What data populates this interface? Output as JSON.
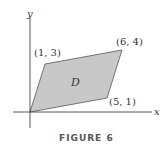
{
  "figure": {
    "caption": "FIGURE 6",
    "x_axis_label": "x",
    "y_axis_label": "y",
    "region_label": "D",
    "region_fill": "#c8c8c8",
    "region_stroke": "#555555",
    "axis_color": "#444444",
    "vertices": [
      {
        "label": "(0, 0)",
        "x": 0,
        "y": 0,
        "shown": false
      },
      {
        "label": "(5, 1)",
        "x": 5,
        "y": 1
      },
      {
        "label": "(6, 4)",
        "x": 6,
        "y": 4
      },
      {
        "label": "(1, 3)",
        "x": 1,
        "y": 3
      }
    ],
    "labels": {
      "v1": "(5, 1)",
      "v2": "(6, 4)",
      "v3": "(1, 3)"
    }
  }
}
